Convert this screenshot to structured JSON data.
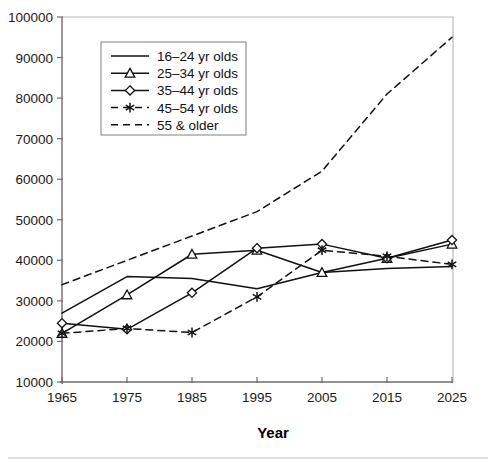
{
  "chart_data": {
    "type": "line",
    "title": "",
    "xlabel": "Year",
    "ylabel": "",
    "x": [
      1965,
      1975,
      1985,
      1995,
      2005,
      2015,
      2025
    ],
    "xtick_labels": [
      "1965",
      "1975",
      "1985",
      "1995",
      "2005",
      "2015",
      "2025"
    ],
    "ytick_labels": [
      "10000",
      "20000",
      "30000",
      "40000",
      "50000",
      "60000",
      "70000",
      "80000",
      "90000",
      "100000"
    ],
    "ylim": [
      10000,
      100000
    ],
    "xlim": [
      1965,
      2025
    ],
    "grid": false,
    "legend_position": "upper-left-inside",
    "series": [
      {
        "name": "16–24 yr olds",
        "marker": "none",
        "dash": "solid",
        "values": [
          27000,
          36000,
          35500,
          33000,
          37000,
          38000,
          38500
        ]
      },
      {
        "name": "25–34 yr olds",
        "marker": "triangle",
        "dash": "solid",
        "values": [
          22000,
          31500,
          41500,
          42500,
          37000,
          40500,
          44000
        ]
      },
      {
        "name": "35–44 yr olds",
        "marker": "diamond",
        "dash": "solid",
        "values": [
          24500,
          23000,
          32000,
          43000,
          44000,
          40500,
          45000
        ]
      },
      {
        "name": "45–54 yr olds",
        "marker": "star",
        "dash": "dashed",
        "values": [
          22000,
          23200,
          22200,
          31000,
          42500,
          41000,
          39000
        ]
      },
      {
        "name": "55 & older",
        "marker": "none",
        "dash": "dashed",
        "values": [
          34000,
          40000,
          46000,
          52000,
          62000,
          81000,
          95000
        ]
      }
    ]
  },
  "axis": {
    "x_title": "Year"
  }
}
